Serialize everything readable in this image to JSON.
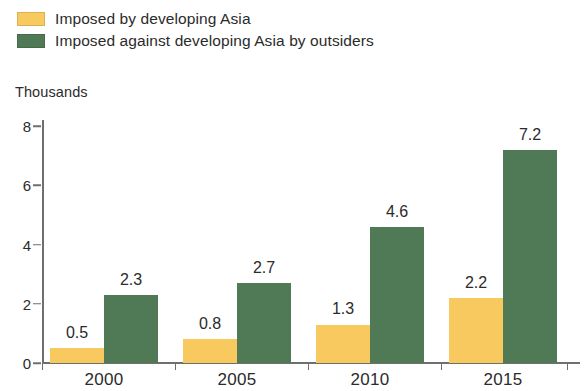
{
  "legend": {
    "position": "top-left",
    "items": [
      {
        "label": "Imposed by developing Asia",
        "color": "#f7c95f",
        "swatch_name": "legend-swatch-imposed-by-developing-asia"
      },
      {
        "label": "Imposed against developing Asia by outsiders",
        "color": "#4f7a55",
        "swatch_name": "legend-swatch-imposed-against-developing-asia"
      }
    ]
  },
  "axis": {
    "unit_caption": "Thousands",
    "y_ticks": [
      "0",
      "2",
      "4",
      "6",
      "8"
    ],
    "x_ticks": [
      "2000",
      "2005",
      "2010",
      "2015"
    ]
  },
  "chart_data": {
    "type": "bar",
    "title": "",
    "subtitle": "",
    "xlabel": "",
    "ylabel": "Thousands",
    "categories": [
      "2000",
      "2005",
      "2010",
      "2015"
    ],
    "series": [
      {
        "name": "Imposed by developing Asia",
        "color": "#f7c95f",
        "values": [
          0.5,
          0.8,
          1.3,
          2.2
        ],
        "labels": [
          "0.5",
          "0.8",
          "1.3",
          "2.2"
        ]
      },
      {
        "name": "Imposed against developing Asia by outsiders",
        "color": "#4f7a55",
        "values": [
          2.3,
          2.7,
          4.6,
          7.2
        ],
        "labels": [
          "2.3",
          "2.7",
          "4.6",
          "7.2"
        ]
      }
    ],
    "ylim": [
      0,
      8
    ],
    "ytick_values": [
      0,
      2,
      4,
      6,
      8
    ],
    "grid": false,
    "legend_position": "top-left",
    "data_labels": true
  }
}
